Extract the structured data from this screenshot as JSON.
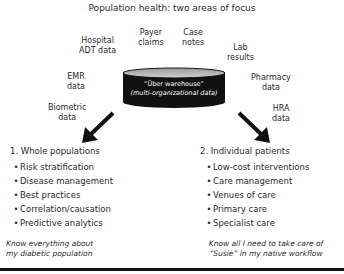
{
  "title": "Population health: two areas of focus",
  "sources": [
    {
      "id": "hospital-adt",
      "lines": [
        "Hospital",
        "ADT data"
      ]
    },
    {
      "id": "payer-claims",
      "lines": [
        "Payer",
        "claims"
      ]
    },
    {
      "id": "case-notes",
      "lines": [
        "Case",
        "notes"
      ]
    },
    {
      "id": "lab-results",
      "lines": [
        "Lab",
        "results"
      ]
    },
    {
      "id": "emr",
      "lines": [
        "EMR",
        "data"
      ]
    },
    {
      "id": "pharmacy",
      "lines": [
        "Pharmacy",
        "data"
      ]
    },
    {
      "id": "biometric",
      "lines": [
        "Biometric",
        "data"
      ]
    },
    {
      "id": "hra",
      "lines": [
        "HRA",
        "data"
      ]
    }
  ],
  "warehouse": {
    "line1": "“Über warehouse”",
    "line2": "(multi-organizational data)",
    "icon": "database-cylinder-icon",
    "fill": "#111111",
    "top_fill": "#b5b5b5"
  },
  "left": {
    "heading": "1. Whole populations",
    "items": [
      "Risk stratification",
      "Disease management",
      "Best practices",
      "Correlation/causation",
      "Predictive analytics"
    ],
    "caption": [
      "Know everything about",
      "my diabetic population"
    ]
  },
  "right": {
    "heading": "2. Individual patients",
    "items": [
      "Low-cost interventions",
      "Care management",
      "Venues of care",
      "Primary care",
      "Specialist care"
    ],
    "caption": [
      "Know all I  need to take care of",
      "“Susie” in my native workflow"
    ]
  },
  "bullet": "•",
  "arrows": {
    "left": "arrow-down-left-icon",
    "right": "arrow-down-right-icon",
    "color": "#111111"
  }
}
